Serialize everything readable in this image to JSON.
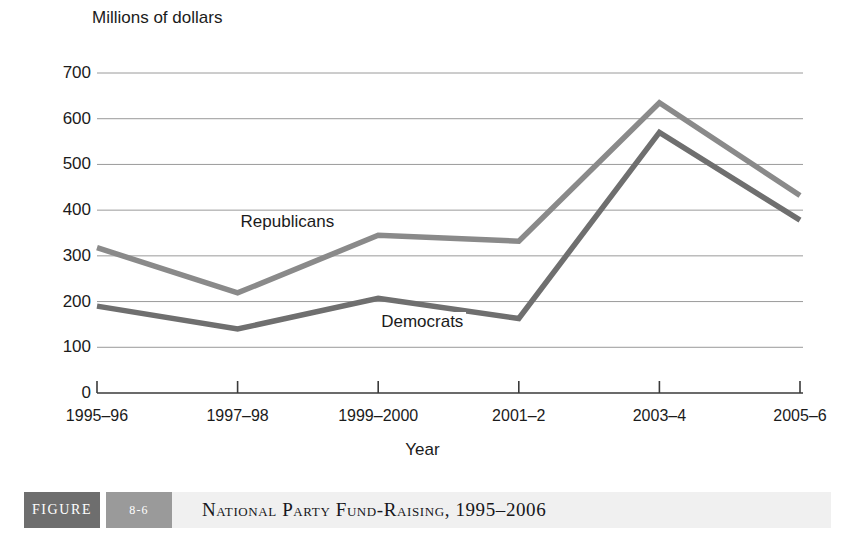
{
  "chart_data": {
    "type": "line",
    "title": "",
    "ylabel": "Millions of dollars",
    "xlabel": "Year",
    "categories": [
      "1995–96",
      "1997–98",
      "1999–2000",
      "2001–2",
      "2003–4",
      "2005–6"
    ],
    "ylim": [
      0,
      700
    ],
    "yticks": [
      0,
      100,
      200,
      300,
      400,
      500,
      600,
      700
    ],
    "ytick_labels": [
      "0",
      "100",
      "200",
      "300",
      "400",
      "500",
      "600",
      "700"
    ],
    "grid": true,
    "grid_axis": "y",
    "legend": "inline-labels",
    "series": [
      {
        "name": "Republicans",
        "color": "#8a8a8a",
        "values": [
          318,
          219,
          345,
          332,
          635,
          432
        ]
      },
      {
        "name": "Democrats",
        "color": "#6f6f6f",
        "values": [
          190,
          140,
          207,
          163,
          570,
          378
        ]
      }
    ],
    "annotations": [
      {
        "text": "Republicans",
        "x_category": "1997–98",
        "y_value": 375
      },
      {
        "text": "Democrats",
        "x_category": "1999–2000",
        "y_value": 155
      }
    ]
  },
  "caption": {
    "figure_label": "FIGURE",
    "figure_number": "8-6",
    "title": "National Party Fund-Raising, 1995–2006"
  }
}
